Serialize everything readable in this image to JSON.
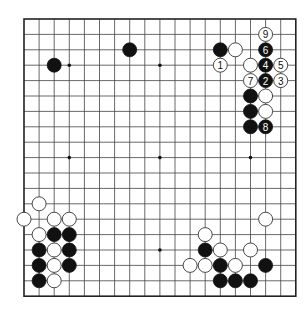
{
  "board": {
    "size": 19,
    "origin_x": 24,
    "origin_y": 19,
    "spacing_x": 15.1,
    "spacing_y": 15.4,
    "stone_radius": 7,
    "colors": {
      "line": "#444444",
      "black": "#111111",
      "white": "#ffffff",
      "background": "#ffffff"
    },
    "star_points": [
      [
        3,
        3
      ],
      [
        9,
        3
      ],
      [
        15,
        3
      ],
      [
        3,
        9
      ],
      [
        9,
        9
      ],
      [
        15,
        9
      ],
      [
        3,
        15
      ],
      [
        9,
        15
      ],
      [
        15,
        15
      ]
    ]
  },
  "stones": [
    {
      "color": "black",
      "col": 2,
      "row": 3
    },
    {
      "color": "black",
      "col": 7,
      "row": 2
    },
    {
      "color": "black",
      "col": 13,
      "row": 2
    },
    {
      "color": "white",
      "col": 14,
      "row": 2
    },
    {
      "color": "white",
      "col": 15,
      "row": 3
    },
    {
      "color": "black",
      "col": 15,
      "row": 5
    },
    {
      "color": "white",
      "col": 16,
      "row": 5
    },
    {
      "color": "black",
      "col": 15,
      "row": 6
    },
    {
      "color": "white",
      "col": 16,
      "row": 6
    },
    {
      "color": "black",
      "col": 15,
      "row": 7
    },
    {
      "color": "white",
      "col": 13,
      "row": 3,
      "label": "1"
    },
    {
      "color": "black",
      "col": 16,
      "row": 4,
      "label": "2"
    },
    {
      "color": "white",
      "col": 17,
      "row": 4,
      "label": "3"
    },
    {
      "color": "black",
      "col": 16,
      "row": 3,
      "label": "4"
    },
    {
      "color": "white",
      "col": 17,
      "row": 3,
      "label": "5"
    },
    {
      "color": "black",
      "col": 16,
      "row": 2,
      "label": "6"
    },
    {
      "color": "white",
      "col": 15,
      "row": 4,
      "label": "7"
    },
    {
      "color": "black",
      "col": 16,
      "row": 7,
      "label": "8"
    },
    {
      "color": "white",
      "col": 16,
      "row": 1,
      "label": "9"
    },
    {
      "color": "white",
      "col": 1,
      "row": 12
    },
    {
      "color": "white",
      "col": 0,
      "row": 13
    },
    {
      "color": "white",
      "col": 2,
      "row": 13
    },
    {
      "color": "white",
      "col": 3,
      "row": 13
    },
    {
      "color": "white",
      "col": 1,
      "row": 14
    },
    {
      "color": "black",
      "col": 2,
      "row": 14
    },
    {
      "color": "black",
      "col": 3,
      "row": 14
    },
    {
      "color": "black",
      "col": 1,
      "row": 15
    },
    {
      "color": "white",
      "col": 2,
      "row": 15
    },
    {
      "color": "black",
      "col": 3,
      "row": 15
    },
    {
      "color": "black",
      "col": 1,
      "row": 16
    },
    {
      "color": "white",
      "col": 2,
      "row": 16
    },
    {
      "color": "black",
      "col": 3,
      "row": 16
    },
    {
      "color": "black",
      "col": 1,
      "row": 17
    },
    {
      "color": "white",
      "col": 2,
      "row": 17
    },
    {
      "color": "white",
      "col": 16,
      "row": 13
    },
    {
      "color": "white",
      "col": 12,
      "row": 14
    },
    {
      "color": "black",
      "col": 12,
      "row": 15
    },
    {
      "color": "white",
      "col": 13,
      "row": 15
    },
    {
      "color": "white",
      "col": 15,
      "row": 15
    },
    {
      "color": "white",
      "col": 11,
      "row": 16
    },
    {
      "color": "white",
      "col": 12,
      "row": 16
    },
    {
      "color": "black",
      "col": 13,
      "row": 16
    },
    {
      "color": "white",
      "col": 14,
      "row": 16
    },
    {
      "color": "black",
      "col": 16,
      "row": 16
    },
    {
      "color": "black",
      "col": 13,
      "row": 17
    },
    {
      "color": "black",
      "col": 14,
      "row": 17
    },
    {
      "color": "black",
      "col": 15,
      "row": 17
    }
  ]
}
